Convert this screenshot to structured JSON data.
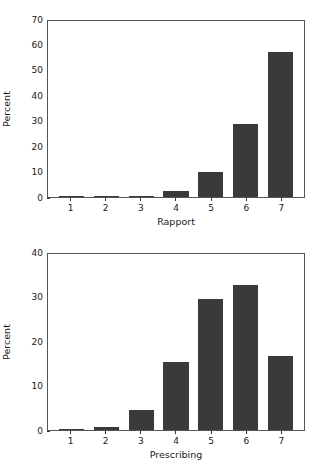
{
  "figure": {
    "background_color": "#ffffff",
    "bar_color": "#3a3a3a",
    "axis_color": "#555555",
    "text_color": "#1a1a1a"
  },
  "chart_data": [
    {
      "type": "bar",
      "title": "",
      "xlabel": "Rapport",
      "ylabel": "Percent",
      "categories": [
        "1",
        "2",
        "3",
        "4",
        "5",
        "6",
        "7"
      ],
      "values": [
        0.2,
        0.3,
        0.4,
        2.2,
        10.0,
        29.0,
        57.5
      ],
      "ylim": [
        0,
        70
      ],
      "yticks": [
        0,
        10,
        20,
        30,
        40,
        50,
        60,
        70
      ],
      "ytick_labels": [
        "0",
        "10",
        "20",
        "30",
        "40",
        "50",
        "60",
        "70"
      ],
      "grid": false,
      "legend": null,
      "bar_color": "#3a3a3a"
    },
    {
      "type": "bar",
      "title": "",
      "xlabel": "Prescribing",
      "ylabel": "Percent",
      "categories": [
        "1",
        "2",
        "3",
        "4",
        "5",
        "6",
        "7"
      ],
      "values": [
        0.2,
        0.6,
        4.5,
        15.4,
        29.7,
        33.0,
        16.8
      ],
      "ylim": [
        0,
        40
      ],
      "yticks": [
        0,
        10,
        20,
        30,
        40
      ],
      "ytick_labels": [
        "0",
        "10",
        "20",
        "30",
        "40"
      ],
      "grid": false,
      "legend": null,
      "bar_color": "#3a3a3a"
    }
  ]
}
